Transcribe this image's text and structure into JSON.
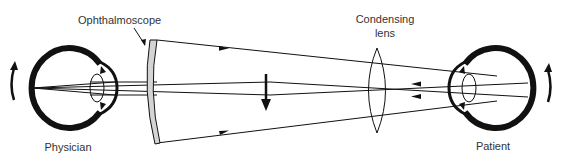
{
  "labels": {
    "ophthalmoscope": "Ophthalmoscope",
    "condensing_lens_line1": "Condensing",
    "condensing_lens_line2": "lens",
    "physician": "Physician",
    "patient": "Patient"
  },
  "elements": {
    "physician_eye": {
      "role": "observer eye",
      "rotation_arrow": "up"
    },
    "patient_eye": {
      "role": "examined eye",
      "rotation_arrow": "up"
    },
    "ophthalmoscope_mirror": {
      "shape": "curved mirror",
      "fill": "#d4d4d4"
    },
    "condensing_lens": {
      "shape": "biconvex lens"
    },
    "intermediate_image_arrow": {
      "direction": "down",
      "meaning": "inverted aerial image"
    },
    "light_rays": {
      "illumination_rays": "from ophthalmoscope toward patient (arrows pointing right)",
      "return_rays": "from patient retina toward physician (arrows pointing left)"
    }
  },
  "colors": {
    "line": "#111111",
    "mirror_fill": "#d4d4d4",
    "text": "#333333",
    "background": "#ffffff"
  }
}
